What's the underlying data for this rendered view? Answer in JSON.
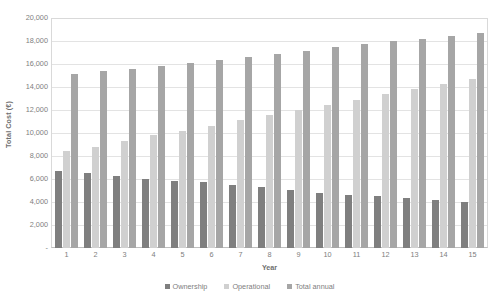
{
  "chart_data": {
    "type": "bar",
    "title": "",
    "xlabel": "Year",
    "ylabel": "Total Cost (€)",
    "categories": [
      "1",
      "2",
      "3",
      "4",
      "5",
      "6",
      "7",
      "8",
      "9",
      "10",
      "11",
      "12",
      "13",
      "14",
      "15"
    ],
    "ylim": [
      0,
      20000
    ],
    "ytick_step": 2000,
    "ytick_labels": [
      "20,000",
      "18,000",
      "16,000",
      "14,000",
      "12,000",
      "10,000",
      "8,000",
      "6,000",
      "4,000",
      "2,000",
      "-"
    ],
    "ytick_values": [
      20000,
      18000,
      16000,
      14000,
      12000,
      10000,
      8000,
      6000,
      4000,
      2000,
      0
    ],
    "grid": true,
    "legend_position": "bottom",
    "series": [
      {
        "name": "Ownership",
        "color": "#7f7f7f",
        "values": [
          6700,
          6550,
          6250,
          6000,
          5850,
          5700,
          5500,
          5300,
          5050,
          4800,
          4600,
          4500,
          4350,
          4200,
          4000
        ]
      },
      {
        "name": "Operational",
        "color": "#d0d0d0",
        "values": [
          8400,
          8800,
          9300,
          9800,
          10200,
          10650,
          11100,
          11600,
          12000,
          12450,
          12900,
          13350,
          13850,
          14250,
          14700
        ]
      },
      {
        "name": "Total annual",
        "color": "#a6a6a6",
        "values": [
          15100,
          15350,
          15550,
          15800,
          16050,
          16350,
          16600,
          16900,
          17100,
          17450,
          17750,
          18000,
          18200,
          18450,
          18700
        ]
      }
    ]
  },
  "legend": {
    "items": [
      {
        "label": "Ownership",
        "color": "#7f7f7f",
        "icon": "legend-swatch-square"
      },
      {
        "label": "Operational",
        "color": "#d0d0d0",
        "icon": "legend-swatch-square"
      },
      {
        "label": "Total annual",
        "color": "#a6a6a6",
        "icon": "legend-swatch-square"
      }
    ]
  }
}
